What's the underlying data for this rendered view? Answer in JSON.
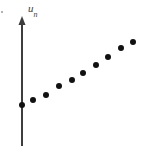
{
  "figure": {
    "background_color": "#ffffff",
    "width": 164,
    "height": 146,
    "stray_mark": {
      "x": 1,
      "y": 11,
      "size": 2
    }
  },
  "axis": {
    "name": "vertical-axis",
    "label_text": "u",
    "label_subscript": "n",
    "color": "#3d3d3d",
    "line_width": 2,
    "x": 22,
    "top_y": 16,
    "bottom_y": 146,
    "arrow_head_width": 7,
    "arrow_head_height": 9,
    "label_position": {
      "x": 28,
      "y": 3
    }
  },
  "chart_data": {
    "type": "scatter",
    "title": "",
    "xlabel": "",
    "ylabel": "u_n",
    "grid": false,
    "legend": null,
    "axis_only_vertical": true,
    "marker": {
      "shape": "circle",
      "color": "#111111",
      "radius_px": 3
    },
    "n_points": 10,
    "x": [
      0,
      1,
      2,
      3,
      4,
      5,
      6,
      7,
      8,
      9
    ],
    "pixel_points": [
      {
        "n": 0,
        "px": 22,
        "py": 105
      },
      {
        "n": 1,
        "px": 33,
        "py": 100
      },
      {
        "n": 2,
        "px": 46,
        "py": 95
      },
      {
        "n": 3,
        "px": 59,
        "py": 86
      },
      {
        "n": 4,
        "px": 72,
        "py": 80
      },
      {
        "n": 5,
        "px": 83,
        "py": 73
      },
      {
        "n": 6,
        "px": 96,
        "py": 65
      },
      {
        "n": 7,
        "px": 108,
        "py": 57
      },
      {
        "n": 8,
        "px": 121,
        "py": 48
      },
      {
        "n": 9,
        "px": 133,
        "py": 42
      }
    ],
    "values": [
      1.0,
      1.15,
      1.3,
      1.57,
      1.75,
      1.96,
      2.2,
      2.44,
      2.71,
      2.89
    ],
    "xlim": [
      -0.4,
      10.0
    ],
    "ylim": [
      0,
      4.0
    ]
  }
}
